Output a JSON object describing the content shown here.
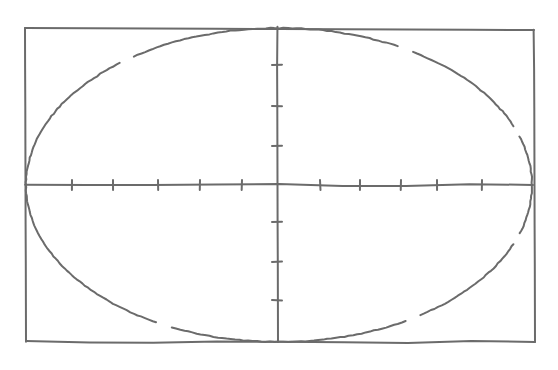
{
  "figure": {
    "stroke_color": "#6b6b6b",
    "background_color": "#ffffff",
    "frame": {
      "x1": 25,
      "y1": 28,
      "x2": 534,
      "y2": 342
    },
    "axes": {
      "x_axis": {
        "y": 185,
        "x_start": 25,
        "x_end": 533
      },
      "y_axis": {
        "x": 277,
        "y_start": 27,
        "y_end": 342
      },
      "x_ticks": [
        72,
        113,
        158,
        200,
        242,
        320,
        360,
        401,
        437,
        482
      ],
      "y_ticks": [
        65,
        106,
        146,
        222,
        262,
        300
      ],
      "tick_half_length": 5
    },
    "ellipse": {
      "cx": 279,
      "cy": 185,
      "rx": 253,
      "ry": 157,
      "stroke_gaps_deg": [
        233,
        300,
        20,
        58,
        117,
        340
      ]
    }
  }
}
